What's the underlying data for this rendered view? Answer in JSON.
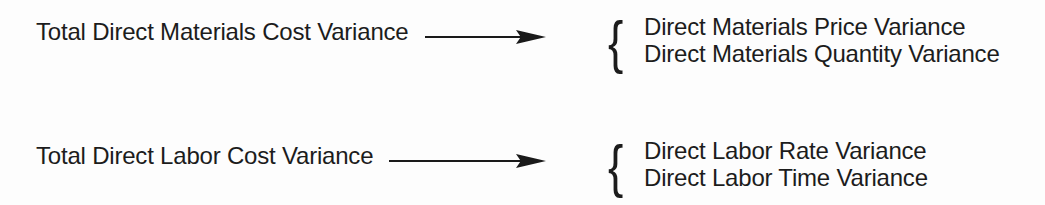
{
  "diagram": {
    "brace_glyph": "{",
    "colors": {
      "background": "#fdfdfd",
      "text": "#1c1c1c",
      "arrow": "#1a1a1a"
    },
    "rows": [
      {
        "source": "Total Direct Materials Cost Variance",
        "components": [
          "Direct Materials Price Variance",
          "Direct Materials Quantity Variance"
        ]
      },
      {
        "source": "Total Direct Labor Cost Variance",
        "components": [
          "Direct Labor Rate Variance",
          "Direct Labor Time Variance"
        ]
      }
    ]
  }
}
